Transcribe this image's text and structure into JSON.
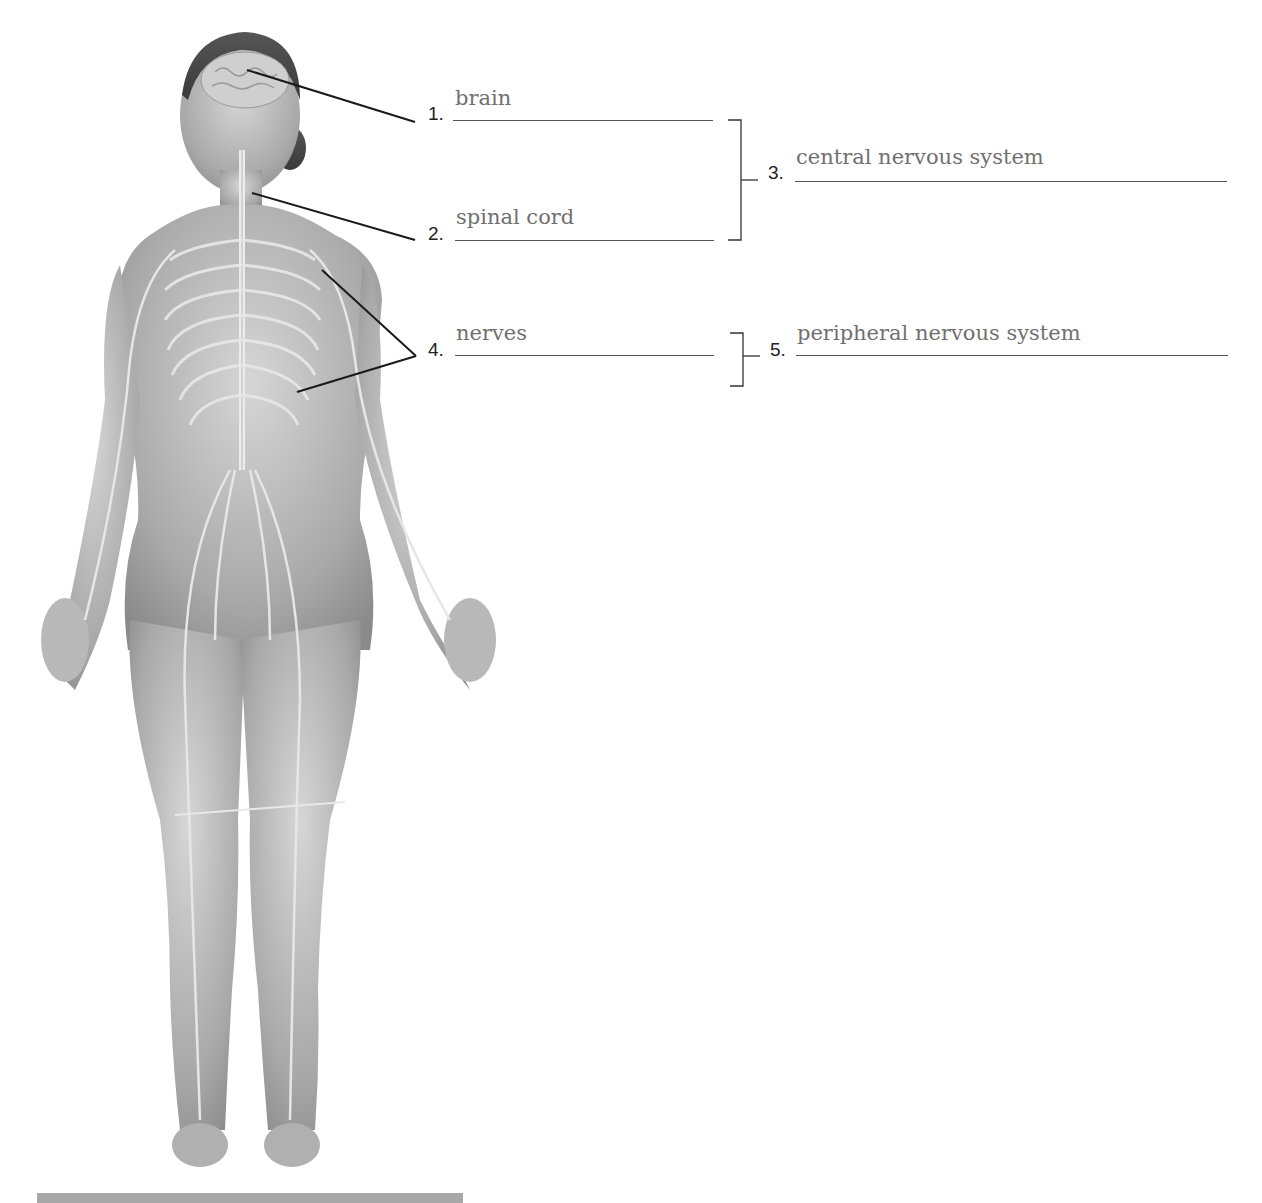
{
  "diagram": {
    "labels": [
      {
        "number": "1.",
        "answer": "brain"
      },
      {
        "number": "2.",
        "answer": "spinal cord"
      },
      {
        "number": "3.",
        "answer": "central nervous system"
      },
      {
        "number": "4.",
        "answer": "nerves"
      },
      {
        "number": "5.",
        "answer": "peripheral nervous system"
      }
    ],
    "groupings": [
      {
        "bracket": "1-2",
        "points_to": "3"
      },
      {
        "bracket": "4",
        "points_to": "5"
      }
    ],
    "colors": {
      "answer_text": "#707070",
      "lines": "#222222",
      "footer_bar": "#a8a8a8"
    }
  }
}
